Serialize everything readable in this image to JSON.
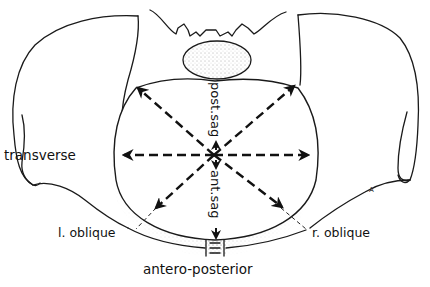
{
  "diagram": {
    "labels": {
      "transverse": "transverse",
      "l_oblique": "l. oblique",
      "r_oblique": "r. oblique",
      "antero_posterior": "antero-posterior",
      "post_sag": "post.sag",
      "ant_sag": "ant.sag",
      "corner_mark": "A"
    },
    "measurements": [
      {
        "name": "transverse",
        "type": "double-arrow",
        "orientation": "horizontal"
      },
      {
        "name": "l. oblique",
        "type": "double-arrow",
        "orientation": "diagonal"
      },
      {
        "name": "r. oblique",
        "type": "double-arrow",
        "orientation": "diagonal"
      },
      {
        "name": "antero-posterior",
        "type": "arrow",
        "orientation": "vertical",
        "segments": [
          "post.sag",
          "ant.sag"
        ]
      }
    ],
    "colors": {
      "line": "#111111",
      "background": "#ffffff",
      "stipple": "#555555"
    }
  }
}
